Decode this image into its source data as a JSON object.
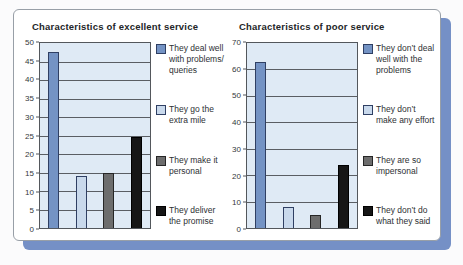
{
  "panel": {
    "background": "#ffffff",
    "border_color": "#989fa7",
    "shadow_color": "#7590c6"
  },
  "chart_data": [
    {
      "type": "bar",
      "title": "Characteristics of excellent service",
      "categories": [
        "They deal well with problems/ queries",
        "They go the extra mile",
        "They make it personal",
        "They deliver the promise"
      ],
      "values": [
        47.5,
        14,
        15,
        24.5
      ],
      "xlabel": "",
      "ylabel": "",
      "ylim": [
        0,
        50
      ],
      "yticks": [
        0,
        5,
        10,
        15,
        20,
        25,
        30,
        35,
        40,
        45,
        50
      ],
      "grid": true,
      "legend_position": "right",
      "plot_background": "#dfeaf5",
      "series_colors": [
        {
          "fill": "#7493c4",
          "border": "#2f3f63"
        },
        {
          "fill": "#c9d9ec",
          "border": "#2f3f63"
        },
        {
          "fill": "#6d6d6d",
          "border": "#262626"
        },
        {
          "fill": "#161616",
          "border": "#000000"
        }
      ]
    },
    {
      "type": "bar",
      "title": "Characteristics of poor service",
      "categories": [
        "They don’t deal well with the problems",
        "They don’t make any effort",
        "They are so impersonal",
        "They don’t do what they said"
      ],
      "values": [
        63,
        8,
        5,
        24
      ],
      "xlabel": "",
      "ylabel": "",
      "ylim": [
        0,
        70
      ],
      "yticks": [
        0,
        10,
        20,
        30,
        40,
        50,
        60,
        70
      ],
      "grid": true,
      "legend_position": "right",
      "plot_background": "#dfeaf5",
      "series_colors": [
        {
          "fill": "#7493c4",
          "border": "#2f3f63"
        },
        {
          "fill": "#c9d9ec",
          "border": "#2f3f63"
        },
        {
          "fill": "#6d6d6d",
          "border": "#262626"
        },
        {
          "fill": "#161616",
          "border": "#000000"
        }
      ]
    }
  ]
}
